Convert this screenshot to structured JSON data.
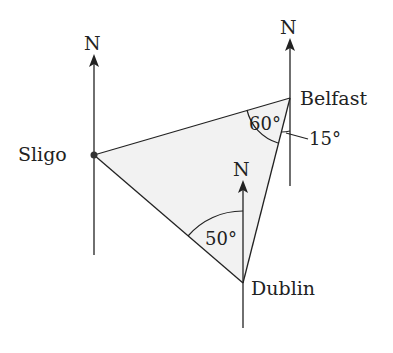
{
  "diagram": {
    "title": "",
    "colors": {
      "line": "#222222",
      "fill": "#f2f2f2",
      "background": "#ffffff"
    },
    "places": [
      {
        "name": "Sligo",
        "x": 94,
        "y": 155
      },
      {
        "name": "Belfast",
        "x": 290,
        "y": 98
      },
      {
        "name": "Dublin",
        "x": 243,
        "y": 283
      }
    ],
    "north_labels": [
      "N",
      "N",
      "N"
    ],
    "angles": [
      {
        "label": "60°",
        "at": "Belfast"
      },
      {
        "label": "15°",
        "at": "Belfast"
      },
      {
        "label": "50°",
        "at": "Dublin"
      }
    ]
  }
}
